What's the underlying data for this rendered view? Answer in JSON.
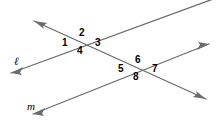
{
  "figure": {
    "type": "geometry-diagram",
    "width": 217,
    "height": 129,
    "background_color": "#ffffff",
    "stroke_color": "#6b6b6b",
    "label_color": "#000000"
  },
  "lines": [
    {
      "id": "line-l",
      "label": "ℓ",
      "label_x": 14,
      "label_y": 56,
      "x1": 11,
      "y1": 73,
      "x2": 216,
      "y2": -2,
      "arrow_start": true,
      "arrow_end": false
    },
    {
      "id": "line-m",
      "label": "m",
      "label_x": 27,
      "label_y": 101,
      "x1": 33,
      "y1": 114,
      "x2": 209,
      "y2": 44,
      "arrow_start": true,
      "arrow_end": true
    },
    {
      "id": "transversal",
      "label": "",
      "label_x": 0,
      "label_y": 0,
      "x1": 34,
      "y1": 21,
      "x2": 206,
      "y2": 99,
      "arrow_start": true,
      "arrow_end": true
    }
  ],
  "intersections": [
    {
      "id": "intersection-top",
      "x": 83,
      "y": 42
    },
    {
      "id": "intersection-bottom",
      "x": 139,
      "y": 68
    }
  ],
  "angles": [
    {
      "number": "1",
      "x": 62,
      "y": 38,
      "intersection": "intersection-top",
      "position": "left"
    },
    {
      "number": "2",
      "x": 79,
      "y": 28,
      "intersection": "intersection-top",
      "position": "top"
    },
    {
      "number": "3",
      "x": 95,
      "y": 38,
      "intersection": "intersection-top",
      "position": "right"
    },
    {
      "number": "4",
      "x": 77,
      "y": 46,
      "intersection": "intersection-top",
      "position": "bottom"
    },
    {
      "number": "5",
      "x": 118,
      "y": 64,
      "intersection": "intersection-bottom",
      "position": "left"
    },
    {
      "number": "6",
      "x": 135,
      "y": 55,
      "intersection": "intersection-bottom",
      "position": "top"
    },
    {
      "number": "7",
      "x": 152,
      "y": 64,
      "intersection": "intersection-bottom",
      "position": "right"
    },
    {
      "number": "8",
      "x": 133,
      "y": 72,
      "intersection": "intersection-bottom",
      "position": "bottom"
    }
  ]
}
